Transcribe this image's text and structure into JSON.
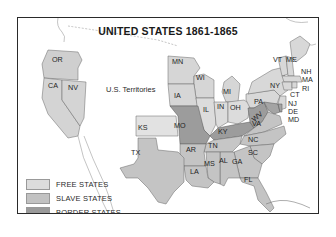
{
  "map": {
    "title": "UNITED STATES 1861-1865",
    "territories_label": "U.S. Territories",
    "colors": {
      "free": "#dcdcdc",
      "slave": "#c2c2c2",
      "border": "#9a9a9a",
      "outline": "#555555",
      "water": "#ffffff",
      "frame": "#2a2a2a"
    },
    "states": {
      "free": [
        "OR",
        "CA",
        "NV",
        "MN",
        "WI",
        "MI",
        "IA",
        "IL",
        "IN",
        "OH",
        "PA",
        "NY",
        "VT",
        "ME",
        "NH",
        "MA",
        "RI",
        "CT",
        "NJ",
        "KS"
      ],
      "slave": [
        "TX",
        "AR",
        "LA",
        "TN",
        "MS",
        "AL",
        "GA",
        "SC",
        "NC",
        "VA",
        "FL"
      ],
      "border": [
        "MO",
        "KY",
        "WV",
        "DE",
        "MD"
      ]
    },
    "labels": {
      "OR": "OR",
      "CA": "CA",
      "NV": "NV",
      "MN": "MN",
      "WI": "WI",
      "MI": "MI",
      "IA": "IA",
      "IL": "IL",
      "IN": "IN",
      "OH": "OH",
      "PA": "PA",
      "NY": "NY",
      "VT": "VT",
      "ME": "ME",
      "NH": "NH",
      "MA": "MA",
      "RI": "RI",
      "CT": "CT",
      "NJ": "NJ",
      "DE": "DE",
      "MD": "MD",
      "KS": "KS",
      "MO": "MO",
      "KY": "KY",
      "WV": "WV",
      "VA": "VA",
      "NC": "NC",
      "TN": "TN",
      "AR": "AR",
      "SC": "SC",
      "TX": "TX",
      "LA": "LA",
      "MS": "MS",
      "AL": "AL",
      "GA": "GA",
      "FL": "FL"
    }
  },
  "legend": {
    "items": [
      {
        "label": "FREE STATES",
        "color": "#dcdcdc"
      },
      {
        "label": "SLAVE STATES",
        "color": "#c2c2c2"
      },
      {
        "label": "BORDER STATES",
        "color": "#9a9a9a"
      }
    ]
  }
}
